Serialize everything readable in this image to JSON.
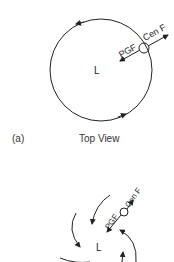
{
  "panel_a": {
    "label": "(a)",
    "title": "Top View",
    "low_label": "L",
    "pgf_label": "PGF",
    "cenf_label": "Cen F"
  },
  "panel_b": {
    "low_label": "L",
    "pgf_label": "PGF",
    "cenf_label": "Cen F"
  },
  "colors": {
    "stroke": "#222222",
    "background": "#ffffff"
  }
}
